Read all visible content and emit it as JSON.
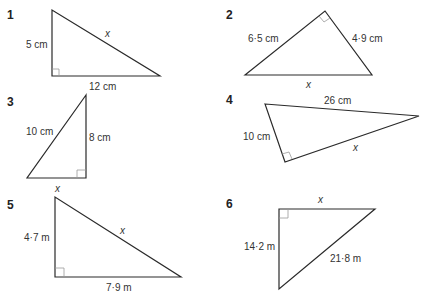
{
  "problems": [
    {
      "number": "1",
      "labels": {
        "left": "5 cm",
        "hyp": "x",
        "bottom": "12 cm"
      }
    },
    {
      "number": "2",
      "labels": {
        "left": "6·5 cm",
        "right": "4·9 cm",
        "bottom": "x"
      }
    },
    {
      "number": "3",
      "labels": {
        "hyp": "10 cm",
        "right": "8 cm",
        "bottom": "x"
      }
    },
    {
      "number": "4",
      "labels": {
        "top": "26 cm",
        "left": "10 cm",
        "bottom": "x"
      }
    },
    {
      "number": "5",
      "labels": {
        "left": "4·7 m",
        "hyp": "x",
        "bottom": "7·9 m"
      }
    },
    {
      "number": "6",
      "labels": {
        "top": "x",
        "left": "14·2 m",
        "hyp": "21·8 m"
      }
    }
  ],
  "colors": {
    "line": "#2a2a2a",
    "right_angle_marker": "#9a9a9a",
    "text": "#333333",
    "background": "#ffffff"
  }
}
